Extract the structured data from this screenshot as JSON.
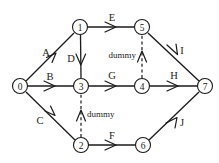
{
  "diagram": {
    "type": "activity-on-arrow-network",
    "stroke_color": "#1a1a1a",
    "background_color": "#ffffff",
    "nodes": [
      {
        "id": "0",
        "label": "0",
        "cx": 20,
        "cy": 86,
        "r": 7.5
      },
      {
        "id": "1",
        "label": "1",
        "cx": 80,
        "cy": 27,
        "r": 7.5
      },
      {
        "id": "2",
        "label": "2",
        "cx": 81,
        "cy": 145,
        "r": 7.5
      },
      {
        "id": "3",
        "label": "3",
        "cx": 81,
        "cy": 86,
        "r": 7.5
      },
      {
        "id": "4",
        "label": "4",
        "cx": 142,
        "cy": 86,
        "r": 7.5
      },
      {
        "id": "5",
        "label": "5",
        "cx": 142,
        "cy": 27,
        "r": 7.5
      },
      {
        "id": "6",
        "label": "6",
        "cx": 143,
        "cy": 145,
        "r": 7.5
      },
      {
        "id": "7",
        "label": "7",
        "cx": 205,
        "cy": 86,
        "r": 7.5
      }
    ],
    "edges": [
      {
        "id": "edge-A",
        "label": "A",
        "from": "0",
        "to": "1",
        "style": "solid",
        "label_x": 46,
        "label_y": 52,
        "label_anchor": "middle"
      },
      {
        "id": "edge-B",
        "label": "B",
        "from": "0",
        "to": "3",
        "style": "solid",
        "label_x": 50,
        "label_y": 76,
        "label_anchor": "middle"
      },
      {
        "id": "edge-C",
        "label": "C",
        "from": "0",
        "to": "2",
        "style": "solid",
        "label_x": 40,
        "label_y": 120,
        "label_anchor": "middle"
      },
      {
        "id": "edge-D",
        "label": "D",
        "from": "1",
        "to": "3",
        "style": "solid",
        "label_x": 71,
        "label_y": 58,
        "label_anchor": "middle"
      },
      {
        "id": "edge-E",
        "label": "E",
        "from": "1",
        "to": "5",
        "style": "solid",
        "label_x": 112,
        "label_y": 17,
        "label_anchor": "middle"
      },
      {
        "id": "edge-F",
        "label": "F",
        "from": "2",
        "to": "6",
        "style": "solid",
        "label_x": 112,
        "label_y": 135,
        "label_anchor": "middle"
      },
      {
        "id": "edge-G",
        "label": "G",
        "from": "3",
        "to": "4",
        "style": "solid",
        "label_x": 112,
        "label_y": 75,
        "label_anchor": "middle"
      },
      {
        "id": "edge-H",
        "label": "H",
        "from": "4",
        "to": "7",
        "style": "solid",
        "label_x": 174,
        "label_y": 75,
        "label_anchor": "middle"
      },
      {
        "id": "edge-I",
        "label": "I",
        "from": "5",
        "to": "7",
        "style": "solid",
        "label_x": 182,
        "label_y": 50,
        "label_anchor": "middle"
      },
      {
        "id": "edge-J",
        "label": "J",
        "from": "6",
        "to": "7",
        "style": "solid",
        "label_x": 182,
        "label_y": 122,
        "label_anchor": "middle"
      },
      {
        "id": "edge-dummy-upper",
        "label": "dummy",
        "from": "4",
        "to": "5",
        "style": "dashed",
        "label_x": 136,
        "label_y": 55,
        "label_anchor": "end"
      },
      {
        "id": "edge-dummy-lower",
        "label": "dummy",
        "from": "2",
        "to": "3",
        "style": "dashed",
        "label_x": 87,
        "label_y": 114,
        "label_anchor": "start"
      }
    ]
  }
}
